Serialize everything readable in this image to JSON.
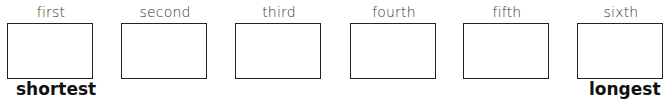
{
  "slots": [
    {
      "label": "first",
      "left": 7
    },
    {
      "label": "second",
      "left": 121
    },
    {
      "label": "third",
      "left": 235
    },
    {
      "label": "fourth",
      "left": 350
    },
    {
      "label": "fifth",
      "left": 463
    },
    {
      "label": "sixth",
      "left": 577
    }
  ],
  "end_labels": {
    "start": "shortest",
    "end": "longest"
  }
}
